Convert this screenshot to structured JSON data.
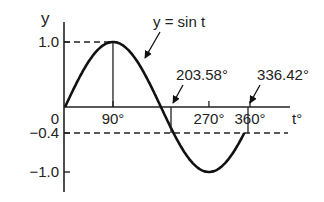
{
  "chart_data": {
    "type": "line",
    "title": "",
    "curve_label": "y = sin t",
    "xlabel": "t°",
    "ylabel": "y",
    "xlim": [
      0,
      360
    ],
    "ylim": [
      -1.0,
      1.0
    ],
    "x_ticks": [
      {
        "value": 0,
        "label": "0"
      },
      {
        "value": 90,
        "label": "90°"
      },
      {
        "value": 270,
        "label": "270°"
      },
      {
        "value": 360,
        "label": "360°"
      }
    ],
    "y_ticks": [
      {
        "value": 1.0,
        "label": "1.0"
      },
      {
        "value": -0.4,
        "label": "−0.4"
      },
      {
        "value": -1.0,
        "label": "−1.0"
      }
    ],
    "series": [
      {
        "name": "y = sin t",
        "x": [
          0,
          30,
          60,
          90,
          120,
          150,
          180,
          210,
          240,
          270,
          300,
          330,
          336.42
        ],
        "values": [
          0,
          0.5,
          0.866,
          1.0,
          0.866,
          0.5,
          0,
          -0.5,
          -0.866,
          -1.0,
          -0.866,
          -0.5,
          -0.4
        ]
      }
    ],
    "reference_lines": [
      {
        "axis": "y",
        "value": 1.0,
        "style": "dashed"
      },
      {
        "axis": "y",
        "value": -0.4,
        "style": "dashed"
      }
    ],
    "annotations": [
      {
        "label": "203.58°",
        "x": 203.58,
        "y": -0.4
      },
      {
        "label": "336.42°",
        "x": 336.42,
        "y": -0.4
      }
    ],
    "grid": false
  }
}
